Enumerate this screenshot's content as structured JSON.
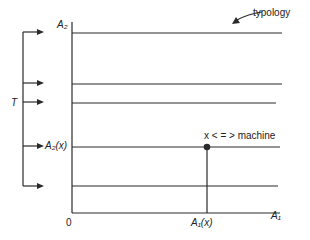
{
  "diagram": {
    "axes": {
      "y_label": "A₂",
      "x_label": "A₁",
      "origin_label": "0"
    },
    "left_bracket_label": "T",
    "y_tick_label": "A₂(x)",
    "x_tick_label": "A₁(x)",
    "point_annotation": "x < = > machine",
    "callout_label": "typology",
    "horizontal_lines_count": 5,
    "arrows_count": 5,
    "colors": {
      "line": "#2a2a2a",
      "background": "#ffffff"
    }
  }
}
